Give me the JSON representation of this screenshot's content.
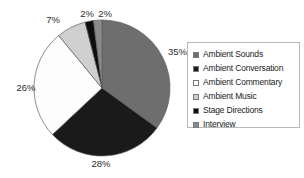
{
  "chart_data": {
    "type": "pie",
    "title": "",
    "categories": [
      "Ambient Sounds",
      "Ambient Conversation",
      "Ambient Commentary",
      "Ambient Music",
      "Stage Directions",
      "Interview"
    ],
    "values": [
      35,
      28,
      26,
      7,
      2,
      2
    ],
    "value_unit": "%",
    "data_labels": [
      "35%",
      "28%",
      "26%",
      "7%",
      "2%",
      "2%"
    ],
    "colors": [
      "#6e6e6e",
      "#1a1a1a",
      "#fdfdfd",
      "#cfcfcf",
      "#0d0d0d",
      "#8a8a8a"
    ],
    "start_angle_deg": 0,
    "direction": "clockwise",
    "grid": false,
    "legend_position": "right",
    "xlabel": "",
    "ylabel": ""
  },
  "legend": {
    "items": [
      {
        "label": "Ambient Sounds",
        "color": "#6e6e6e"
      },
      {
        "label": "Ambient Conversation",
        "color": "#1a1a1a"
      },
      {
        "label": "Ambient Commentary",
        "color": "#fdfdfd"
      },
      {
        "label": "Ambient Music",
        "color": "#cfcfcf"
      },
      {
        "label": "Stage Directions",
        "color": "#0d0d0d"
      },
      {
        "label": "Interview",
        "color": "#8a8a8a"
      }
    ]
  },
  "labels": {
    "slice_0": "35%",
    "slice_1": "28%",
    "slice_2": "26%",
    "slice_3": "7%",
    "slice_4": "2%",
    "slice_5": "2%"
  }
}
